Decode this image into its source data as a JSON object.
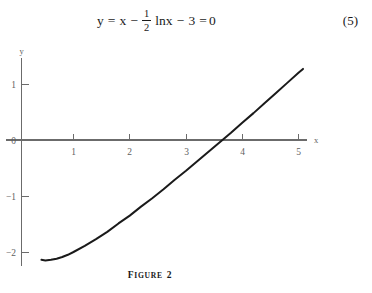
{
  "equation": {
    "number": "(5)",
    "lhs": "y",
    "eq1": "=",
    "term_x": "x",
    "minus1": "−",
    "fraction_numerator": "1",
    "fraction_denominator": "2",
    "term_ln": "lnx",
    "minus2": "−",
    "term_const": "3",
    "eq2": "=",
    "rhs": "0",
    "plain_text": "y = x − 1/2 lnx − 3 = 0"
  },
  "figure": {
    "caption_word": "Figure",
    "caption_number": "2",
    "caption_full": "FIGURE 2"
  },
  "chart_data": {
    "type": "line",
    "title": "",
    "subtitle": "",
    "xlabel": "x",
    "ylabel": "y",
    "xlim": [
      0,
      5.45
    ],
    "ylim": [
      -2.25,
      1.45
    ],
    "xticks": [
      1,
      2,
      3,
      4,
      5
    ],
    "xtick_labels": [
      "1",
      "2",
      "3",
      "4",
      "5"
    ],
    "yticks": [
      1,
      0,
      -1,
      -2
    ],
    "ytick_labels": [
      "1",
      "0",
      "−1",
      "−2"
    ],
    "grid": false,
    "legend": null,
    "annotations": [],
    "series": [
      {
        "name": "y = x - 0.5*ln(x) - 3",
        "color": "#1a1a1a",
        "linewidth": 2,
        "x": [
          0.43,
          0.5,
          0.6,
          0.7,
          0.8,
          0.9,
          1.0,
          1.2,
          1.4,
          1.6,
          1.8,
          2.0,
          2.2,
          2.4,
          2.6,
          2.8,
          3.0,
          3.2,
          3.4,
          3.6,
          3.8,
          4.0,
          4.2,
          4.4,
          4.6,
          4.8,
          5.0,
          5.08
        ],
        "y": [
          -2.14,
          -2.15,
          -2.14,
          -2.12,
          -2.09,
          -2.05,
          -2.0,
          -1.89,
          -1.77,
          -1.64,
          -1.49,
          -1.35,
          -1.19,
          -1.04,
          -0.88,
          -0.71,
          -0.55,
          -0.38,
          -0.21,
          -0.04,
          0.13,
          0.31,
          0.48,
          0.66,
          0.84,
          1.02,
          1.2,
          1.27
        ],
        "root_x": 3.73
      }
    ],
    "axis_color": "#6b6b6b",
    "tick_label_color": "#5f5f5f"
  }
}
